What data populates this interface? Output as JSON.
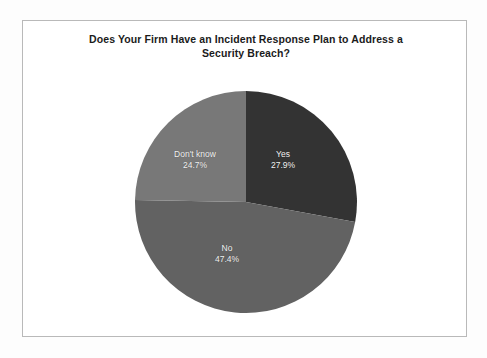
{
  "chart_data": {
    "type": "pie",
    "title": "Does Your Firm Have an Incident Response Plan to Address a Security Breach?",
    "title_line1": "Does Your Firm Have an Incident Response Plan to Address a Security",
    "title_line2": "Breach?",
    "categories": [
      "Yes",
      "No",
      "Don't know"
    ],
    "values": [
      27.9,
      47.4,
      24.7
    ],
    "value_labels": [
      "27.9%",
      "47.4%",
      "24.7%"
    ],
    "unit": "%",
    "legend": "none",
    "start_angle_deg": 0,
    "direction": "clockwise",
    "slices": [
      {
        "label": "Yes",
        "value": 27.9,
        "value_label": "27.9%",
        "color": "#333333"
      },
      {
        "label": "No",
        "value": 47.4,
        "value_label": "47.4%",
        "color": "#626262"
      },
      {
        "label": "Don't know",
        "value": 24.7,
        "value_label": "24.7%",
        "color": "#787878"
      }
    ],
    "xlabel": "",
    "ylabel": ""
  },
  "frame": {
    "border_color": "#b9b9b9",
    "background": "#ffffff"
  },
  "title_color": "#1b1b1b",
  "label_color": "#f2f2f2"
}
